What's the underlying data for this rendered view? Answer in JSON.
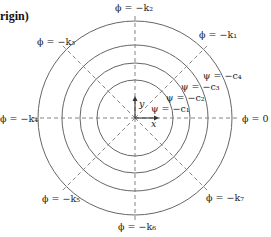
{
  "title": "rigin)",
  "colors": {
    "circle": "#666666",
    "ray": "#777777",
    "text": "#222222",
    "axis": "#333333"
  },
  "center": {
    "x": 135,
    "y": 118
  },
  "circles": [
    {
      "radius": 38,
      "label": "ψ = −c₁",
      "lx": 151,
      "ly": 112
    },
    {
      "radius": 55,
      "label": "ψ = −c₂",
      "lx": 166,
      "ly": 101
    },
    {
      "radius": 73,
      "label": "ψ = −c₃",
      "lx": 181,
      "ly": 90
    },
    {
      "radius": 97,
      "label": "ψ = −c₄",
      "lx": 203,
      "ly": 79
    }
  ],
  "rays": [
    {
      "angle": 0,
      "label": "ϕ = 0",
      "lx": 242,
      "ly": 122
    },
    {
      "angle": 45,
      "label": "ϕ = −k₁",
      "lx": 199,
      "ly": 38
    },
    {
      "angle": 90,
      "label": "ϕ = −k₂",
      "lx": 115,
      "ly": 11
    },
    {
      "angle": 135,
      "label": "ϕ = −k₃",
      "lx": 37,
      "ly": 45
    },
    {
      "angle": 180,
      "label": "ϕ = −k₄",
      "lx": 0,
      "ly": 122
    },
    {
      "angle": 225,
      "label": "ϕ = −k₅",
      "lx": 42,
      "ly": 202
    },
    {
      "angle": 270,
      "label": "ϕ = −k₆",
      "lx": 118,
      "ly": 230
    },
    {
      "angle": 315,
      "label": "ϕ = −k₇",
      "lx": 206,
      "ly": 201
    }
  ],
  "axes": {
    "x_label": "x",
    "y_label": "y"
  }
}
